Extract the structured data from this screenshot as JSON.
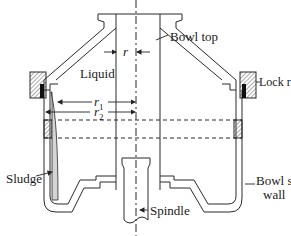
{
  "diagram": {
    "type": "cross-section",
    "labels": {
      "bowl_top": "Bowl top",
      "lock_ring": "Lock ring",
      "liquid": "Liquid",
      "sludge": "Sludge",
      "bowl_shell_wall_line1": "Bowl shell",
      "bowl_shell_wall_line2": "wall",
      "spindle": "Spindle",
      "r": "r",
      "r1": "r",
      "r1_sub": "1",
      "r2": "r",
      "r2_sub": "2"
    },
    "colors": {
      "line": "#2a2a2a",
      "sludge_fill": "#d4d4d4",
      "hatch": "#555555",
      "background": "#ffffff"
    }
  }
}
